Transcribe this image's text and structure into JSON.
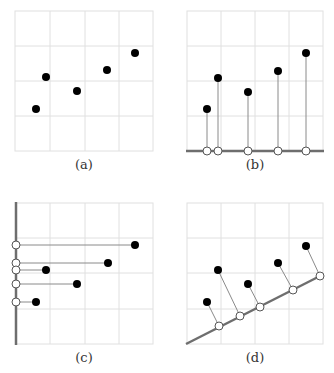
{
  "colors": {
    "grid": "#e0e0e0",
    "axis": "#6e6e6e",
    "point": "#000000",
    "projection_line": "#8a8a8a",
    "projected_point_fill": "#ffffff",
    "projected_point_stroke": "#555555"
  },
  "panels": [
    {
      "id": "a",
      "caption": "(a)",
      "description": "Scatter of five 2D points on a 4x4 grid"
    },
    {
      "id": "b",
      "caption": "(b)",
      "description": "Points projected vertically onto horizontal axis"
    },
    {
      "id": "c",
      "caption": "(c)",
      "description": "Points projected horizontally onto vertical axis"
    },
    {
      "id": "d",
      "caption": "(d)",
      "description": "Points projected orthogonally onto a sloped line"
    }
  ],
  "points_grid_units": [
    {
      "x": 0.6,
      "y": 1.2
    },
    {
      "x": 0.9,
      "y": 2.1
    },
    {
      "x": 1.8,
      "y": 1.7
    },
    {
      "x": 2.7,
      "y": 2.3
    },
    {
      "x": 3.5,
      "y": 2.8
    }
  ]
}
